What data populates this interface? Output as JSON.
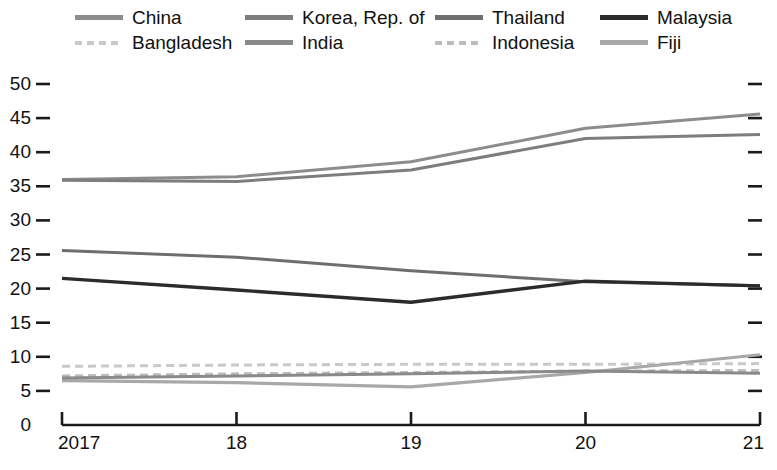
{
  "chart_data": {
    "type": "line",
    "title": "",
    "subtitle": "",
    "xlabel": "",
    "ylabel": "",
    "x": [
      "2017",
      "18",
      "19",
      "20",
      "21"
    ],
    "xtick_labels": [
      "2017",
      "18",
      "19",
      "20",
      "21"
    ],
    "ytick_labels": [
      "0",
      "5",
      "10",
      "15",
      "20",
      "25",
      "30",
      "35",
      "40",
      "45",
      "50"
    ],
    "ylim": [
      0,
      50
    ],
    "yticks": [
      0,
      5,
      10,
      15,
      20,
      25,
      30,
      35,
      40,
      45,
      50
    ],
    "grid": false,
    "legend_position": "top",
    "ticks_both_sides": true,
    "series": [
      {
        "name": "China",
        "color": "#8c8c8c",
        "style": "solid",
        "width": 3.0,
        "values": [
          36.0,
          36.4,
          38.6,
          43.5,
          45.6
        ]
      },
      {
        "name": "Bangladesh",
        "color": "#c9c9c9",
        "style": "dashed",
        "width": 3.0,
        "values": [
          8.6,
          8.8,
          8.9,
          8.9,
          9.0
        ]
      },
      {
        "name": "Korea, Rep. of",
        "color": "#7d7d7d",
        "style": "solid",
        "width": 3.0,
        "values": [
          35.9,
          35.7,
          37.4,
          42.0,
          42.6
        ]
      },
      {
        "name": "India",
        "color": "#8a8a8a",
        "style": "solid",
        "width": 3.0,
        "values": [
          6.9,
          7.2,
          7.5,
          7.9,
          7.6
        ]
      },
      {
        "name": "Thailand",
        "color": "#6e6e6e",
        "style": "solid",
        "width": 3.0,
        "values": [
          25.6,
          24.6,
          22.6,
          21.0,
          20.4
        ]
      },
      {
        "name": "Indonesia",
        "color": "#bdbdbd",
        "style": "dashed",
        "width": 3.0,
        "values": [
          7.2,
          7.5,
          7.7,
          7.9,
          8.0
        ]
      },
      {
        "name": "Malaysia",
        "color": "#2b2b2b",
        "style": "solid",
        "width": 3.4,
        "values": [
          21.5,
          19.8,
          18.0,
          21.1,
          20.4
        ]
      },
      {
        "name": "Fiji",
        "color": "#a8a8a8",
        "style": "solid",
        "width": 3.2,
        "values": [
          6.5,
          6.2,
          5.6,
          7.7,
          10.3
        ]
      }
    ]
  },
  "legend": {
    "items": [
      {
        "label": "China",
        "color": "#8c8c8c",
        "style": "solid",
        "col": 0,
        "row": 0
      },
      {
        "label": "Korea, Rep. of",
        "color": "#7d7d7d",
        "style": "solid",
        "col": 1,
        "row": 0
      },
      {
        "label": "Thailand",
        "color": "#6e6e6e",
        "style": "solid",
        "col": 2,
        "row": 0
      },
      {
        "label": "Malaysia",
        "color": "#2b2b2b",
        "style": "solid",
        "col": 3,
        "row": 0
      },
      {
        "label": "Bangladesh",
        "color": "#c9c9c9",
        "style": "dashed",
        "col": 0,
        "row": 1
      },
      {
        "label": "India",
        "color": "#8a8a8a",
        "style": "solid",
        "col": 1,
        "row": 1
      },
      {
        "label": "Indonesia",
        "color": "#bdbdbd",
        "style": "dashed",
        "col": 2,
        "row": 1
      },
      {
        "label": "Fiji",
        "color": "#a8a8a8",
        "style": "solid",
        "col": 3,
        "row": 1
      }
    ]
  },
  "axes": {
    "axis_color": "#1a1a1a",
    "tick_color": "#1a1a1a"
  }
}
